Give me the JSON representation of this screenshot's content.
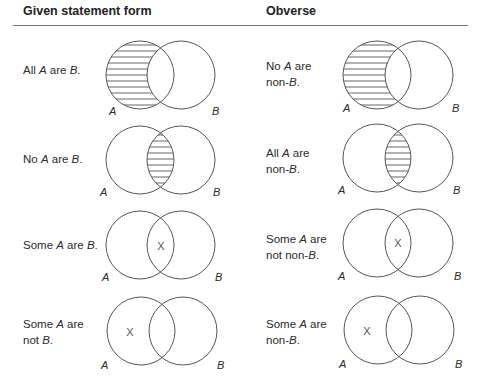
{
  "header": {
    "left_title": "Given statement form",
    "right_title": "Obverse"
  },
  "rows": [
    {
      "given": {
        "parts": [
          "All ",
          "A",
          " are ",
          "B",
          "."
        ],
        "shading": "A-only",
        "x_mark": null
      },
      "obverse": {
        "line1": [
          "No ",
          "A",
          " are"
        ],
        "line2": [
          "non-",
          "B",
          "."
        ],
        "shading": "A-only",
        "x_mark": null
      }
    },
    {
      "given": {
        "parts": [
          "No ",
          "A",
          " are ",
          "B",
          "."
        ],
        "shading": "intersection",
        "x_mark": null
      },
      "obverse": {
        "line1": [
          "All ",
          "A",
          " are"
        ],
        "line2": [
          "non-",
          "B",
          "."
        ],
        "shading": "intersection",
        "x_mark": null
      }
    },
    {
      "given": {
        "parts": [
          "Some ",
          "A",
          " are ",
          "B",
          "."
        ],
        "shading": null,
        "x_mark": "intersection"
      },
      "obverse": {
        "line1": [
          "Some ",
          "A",
          " are"
        ],
        "line2": [
          "not non-",
          "B",
          "."
        ],
        "shading": null,
        "x_mark": "intersection"
      }
    },
    {
      "given": {
        "line1": [
          "Some ",
          "A",
          " are"
        ],
        "line2": [
          "not ",
          "B",
          "."
        ],
        "shading": null,
        "x_mark": "A-only"
      },
      "obverse": {
        "line1": [
          "Some ",
          "A",
          " are"
        ],
        "line2": [
          "non-",
          "B",
          "."
        ],
        "shading": null,
        "x_mark": "A-only"
      }
    }
  ],
  "labels": {
    "circle_a": "A",
    "circle_b": "B",
    "x_mark": "X"
  },
  "colors": {
    "stroke": "#555555",
    "text": "#2a2a2a",
    "rule": "#777777"
  }
}
